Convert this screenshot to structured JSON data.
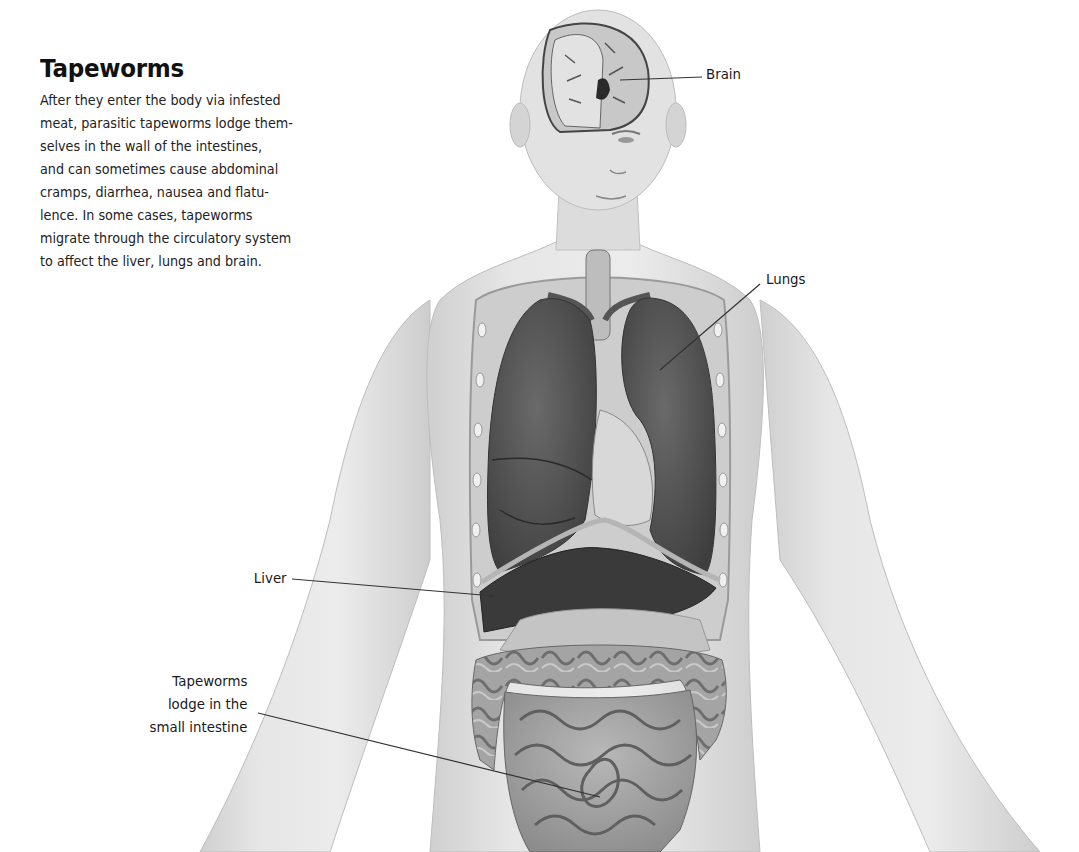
{
  "title": "Tapeworms",
  "body_lines": [
    "After they enter the body via infested",
    "meat, parasitic tapeworms lodge them-",
    "selves in the wall of the intestines,",
    "and can sometimes cause abdominal",
    "cramps, diarrhea, nausea and flatu-",
    "lence. In some cases, tapeworms",
    "migrate through the circulatory system",
    "to affect the liver, lungs and brain."
  ],
  "labels": {
    "brain": {
      "text": "Brain",
      "x": 706,
      "y": 66
    },
    "lungs": {
      "text": "Lungs",
      "x": 766,
      "y": 270
    },
    "liver": {
      "text": "Liver",
      "x": 248,
      "y": 567
    },
    "intestine": {
      "lines": [
        "Tapeworms",
        "lodge in the",
        "small intestine"
      ],
      "right": 832,
      "y": 670
    }
  },
  "colors": {
    "skin": "#e4e4e4",
    "skin_shadow": "#c9c9c9",
    "organ_dark": "#4a4a4a",
    "lung": "#5a5a5a",
    "intestine": "#a8a8a8",
    "leader_line": "#333333"
  },
  "figure": {
    "organs_shown": [
      "brain",
      "lungs",
      "liver",
      "heart",
      "stomach",
      "large intestine",
      "small intestine"
    ]
  }
}
